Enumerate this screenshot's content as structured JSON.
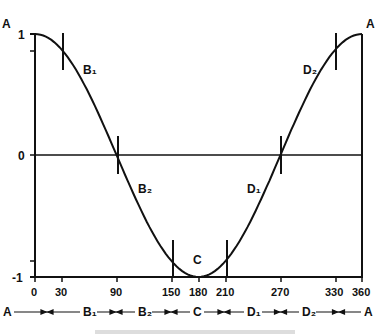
{
  "chart_data": {
    "type": "line",
    "title": "",
    "function": "cos(x)",
    "x": [
      0,
      30,
      90,
      150,
      180,
      210,
      270,
      330,
      360
    ],
    "y": [
      1,
      0.866,
      0,
      -0.866,
      -1,
      -0.866,
      0,
      0.866,
      1
    ],
    "xlabel": "",
    "ylabel": "",
    "xlim": [
      0,
      360
    ],
    "ylim": [
      -1,
      1
    ],
    "x_ticks": [
      "0",
      "30",
      "90",
      "150",
      "180",
      "210",
      "270",
      "330",
      "360"
    ],
    "y_ticks": [
      "1",
      "0",
      "-1"
    ],
    "grid": false,
    "markers": [
      {
        "x": 30,
        "label": "B₁"
      },
      {
        "x": 90,
        "label": "B₂"
      },
      {
        "x": 150,
        "label": ""
      },
      {
        "x": 210,
        "label": ""
      },
      {
        "x": 270,
        "label": "D₁"
      },
      {
        "x": 330,
        "label": "D₂"
      }
    ],
    "point_labels": {
      "start": "A",
      "end": "A",
      "min": "C"
    },
    "phase_sequence": [
      "A",
      "B₁",
      "B₂",
      "C",
      "D₁",
      "D₂",
      "A"
    ]
  },
  "labels": {
    "top_left": "A",
    "top_right": "A",
    "y1": "1",
    "y0": "0",
    "ym1": "-1",
    "b1": "B₁",
    "b2": "B₂",
    "c": "C",
    "d1": "D₁",
    "d2": "D₂",
    "x": [
      "0",
      "30",
      "90",
      "150",
      "180",
      "210",
      "270",
      "330",
      "360"
    ],
    "seq": [
      "A",
      "B₁",
      "B₂",
      "C",
      "D₁",
      "D₂",
      "A"
    ]
  }
}
